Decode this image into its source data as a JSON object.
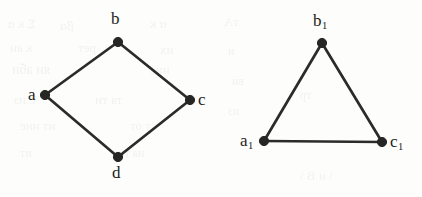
{
  "figure": {
    "background_color": "#fdfdfc",
    "ink_color": "#262624",
    "width": 422,
    "height": 197
  },
  "graphs": [
    {
      "id": "left-graph",
      "name": "four-cycle-graph",
      "shape": "diamond",
      "vertices": [
        {
          "id": "a",
          "label": "a",
          "subscript": "",
          "x": 45,
          "y": 95,
          "label_x": 28,
          "label_y": 86
        },
        {
          "id": "b",
          "label": "b",
          "subscript": "",
          "x": 118,
          "y": 42,
          "label_x": 111,
          "label_y": 10
        },
        {
          "id": "c",
          "label": "c",
          "subscript": "",
          "x": 190,
          "y": 100,
          "label_x": 198,
          "label_y": 91
        },
        {
          "id": "d",
          "label": "d",
          "subscript": "",
          "x": 118,
          "y": 157,
          "label_x": 112,
          "label_y": 164
        }
      ],
      "edges": [
        {
          "from": "a",
          "to": "b"
        },
        {
          "from": "b",
          "to": "c"
        },
        {
          "from": "c",
          "to": "d"
        },
        {
          "from": "d",
          "to": "a"
        }
      ]
    },
    {
      "id": "right-graph",
      "name": "triangle-graph",
      "shape": "triangle",
      "vertices": [
        {
          "id": "a1",
          "label": "a",
          "subscript": "1",
          "x": 264,
          "y": 141,
          "label_x": 240,
          "label_y": 132
        },
        {
          "id": "b1",
          "label": "b",
          "subscript": "1",
          "x": 322,
          "y": 43,
          "label_x": 313,
          "label_y": 12
        },
        {
          "id": "c1",
          "label": "c",
          "subscript": "1",
          "x": 382,
          "y": 142,
          "label_x": 390,
          "label_y": 133
        }
      ],
      "edges": [
        {
          "from": "a1",
          "to": "b1"
        },
        {
          "from": "b1",
          "to": "c1"
        },
        {
          "from": "a1",
          "to": "c1"
        }
      ]
    }
  ],
  "background_ghosts": [
    {
      "text": "Σ к α",
      "x": 8,
      "y": 16,
      "size": 13,
      "rot": -1
    },
    {
      "text": "βα",
      "x": 60,
      "y": 18,
      "size": 13,
      "rot": 0
    },
    {
      "text": "α к",
      "x": 150,
      "y": 16,
      "size": 13,
      "rot": 0
    },
    {
      "text": "к ан",
      "x": 10,
      "y": 40,
      "size": 13,
      "rot": 0
    },
    {
      "text": "рет",
      "x": 78,
      "y": 40,
      "size": 13,
      "rot": 0
    },
    {
      "text": "их",
      "x": 160,
      "y": 42,
      "size": 13,
      "rot": 0
    },
    {
      "text": "яи аби",
      "x": 12,
      "y": 62,
      "size": 14,
      "rot": 0
    },
    {
      "text": "нис",
      "x": 150,
      "y": 62,
      "size": 13,
      "rot": 0
    },
    {
      "text": "с из",
      "x": 14,
      "y": 92,
      "size": 13,
      "rot": 0
    },
    {
      "text": "тя ти",
      "x": 95,
      "y": 92,
      "size": 13,
      "rot": 0
    },
    {
      "text": "ит ние",
      "x": 20,
      "y": 118,
      "size": 13,
      "rot": 0
    },
    {
      "text": "т от",
      "x": 130,
      "y": 118,
      "size": 13,
      "rot": 0
    },
    {
      "text": "ит",
      "x": 20,
      "y": 146,
      "size": 12,
      "rot": 0
    },
    {
      "text": "ия ти",
      "x": 118,
      "y": 146,
      "size": 12,
      "rot": 0
    },
    {
      "text": "тА",
      "x": 224,
      "y": 14,
      "size": 13,
      "rot": 0
    },
    {
      "text": "и",
      "x": 228,
      "y": 44,
      "size": 12,
      "rot": 0
    },
    {
      "text": "ви",
      "x": 232,
      "y": 74,
      "size": 12,
      "rot": 0
    },
    {
      "text": "из",
      "x": 228,
      "y": 104,
      "size": 12,
      "rot": 0
    },
    {
      "text": "тр",
      "x": 300,
      "y": 88,
      "size": 12,
      "rot": 0
    },
    {
      "text": "\\ и В \\",
      "x": 300,
      "y": 168,
      "size": 13,
      "rot": 0
    }
  ]
}
